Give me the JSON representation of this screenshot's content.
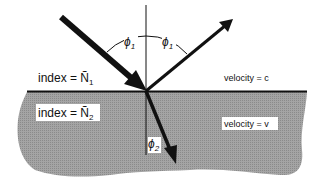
{
  "diagram": {
    "labels": {
      "index_top": "index = Ñ",
      "index_top_sub": "1",
      "index_bottom": "index = Ñ",
      "index_bottom_sub": "2",
      "velocity_top": "velocity = c",
      "velocity_bottom": "velocity = v",
      "phi": "ϕ",
      "phi1_sub": "1",
      "phi2_sub": "2"
    },
    "colors": {
      "medium_fill": "#9a9a9a",
      "line": "#111111",
      "background": "#ffffff"
    }
  }
}
